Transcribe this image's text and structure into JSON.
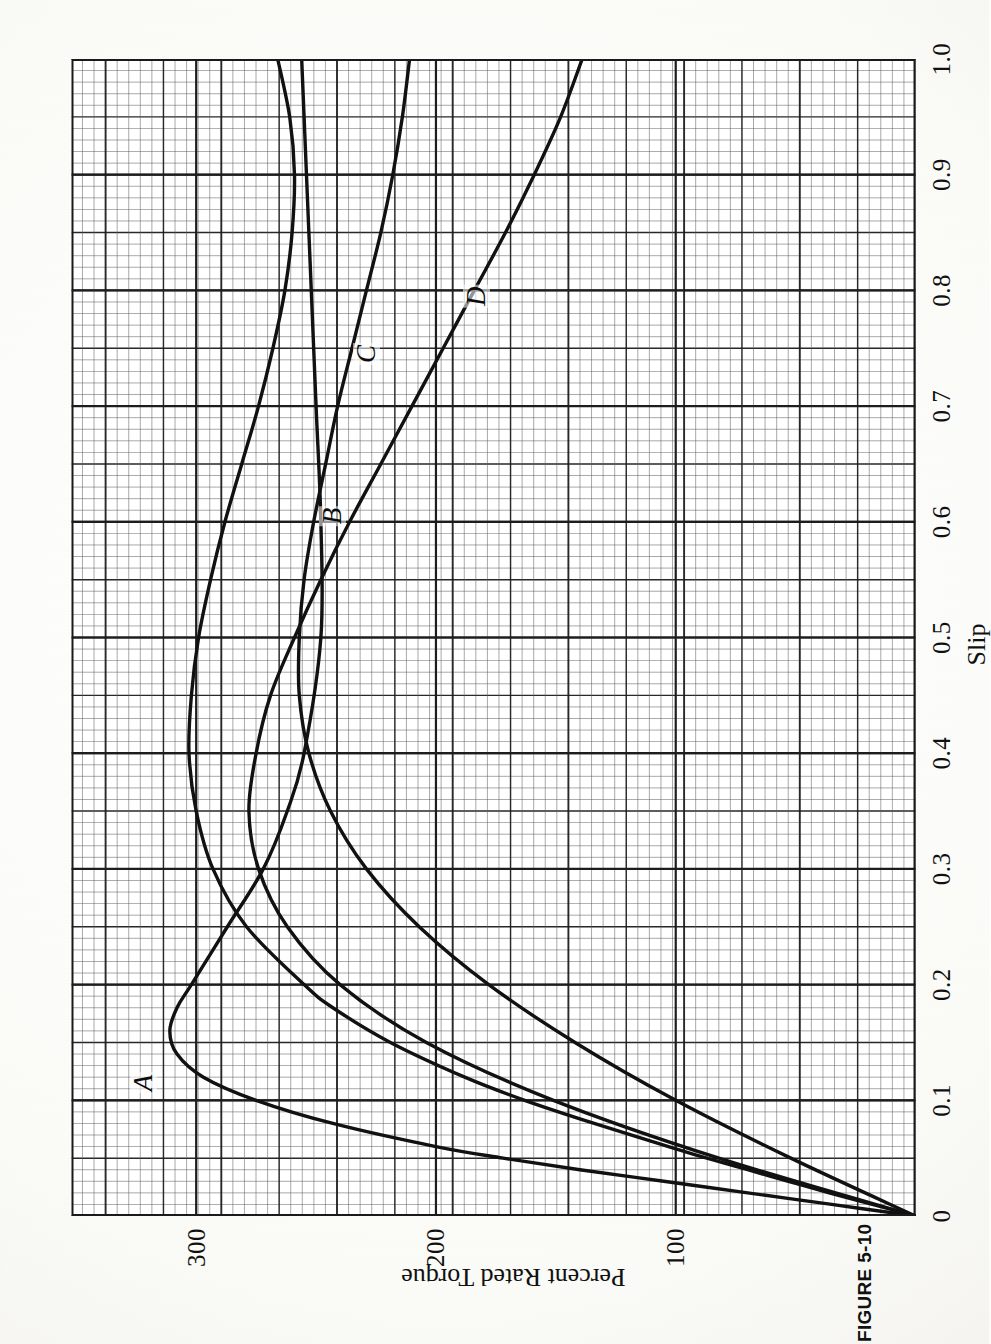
{
  "figure": {
    "caption": "FIGURE 5-10",
    "rotation_note": "printed sideways (rotated 90 degrees counter-clockwise)"
  },
  "chart_data": {
    "type": "line",
    "title": "",
    "xlabel": "Slip",
    "ylabel": "Percent Rated Torque",
    "xlim": [
      0,
      1.0
    ],
    "ylim": [
      0,
      352
    ],
    "grid": true,
    "grid_style": "engineering graph paper, minor cells with heavy line every 5 cells",
    "legend": "inline curve labels A, B, C, D",
    "xticks": [
      "0",
      "0.1",
      "0.2",
      "0.3",
      "0.4",
      "0.5",
      "0.6",
      "0.7",
      "0.8",
      "0.9",
      "1.0"
    ],
    "xtick_values": [
      0,
      0.1,
      0.2,
      0.3,
      0.4,
      0.5,
      0.6,
      0.7,
      0.8,
      0.9,
      1.0
    ],
    "yticks": [
      "100",
      "200",
      "300"
    ],
    "ytick_values": [
      100,
      200,
      300
    ],
    "series": [
      {
        "name": "A",
        "label": "A",
        "label_at": {
          "x": 0.115,
          "y": 322
        },
        "x": [
          0,
          0.01,
          0.02,
          0.03,
          0.04,
          0.05,
          0.06,
          0.08,
          0.1,
          0.12,
          0.14,
          0.16,
          0.18,
          0.2,
          0.25,
          0.3,
          0.35,
          0.4,
          0.5,
          0.6,
          0.7,
          0.8,
          0.9,
          1.0
        ],
        "y": [
          0,
          35,
          70,
          105,
          140,
          172,
          200,
          243,
          275,
          297,
          308,
          311,
          308,
          302,
          287,
          272,
          262,
          255,
          248,
          248,
          250,
          252,
          254,
          256
        ]
      },
      {
        "name": "B",
        "label": "B",
        "label_at": {
          "x": 0.605,
          "y": 243
        },
        "x": [
          0,
          0.01,
          0.02,
          0.03,
          0.04,
          0.05,
          0.06,
          0.08,
          0.1,
          0.12,
          0.15,
          0.18,
          0.2,
          0.25,
          0.3,
          0.35,
          0.4,
          0.45,
          0.5,
          0.55,
          0.6,
          0.65,
          0.7,
          0.75,
          0.8,
          0.85,
          0.9,
          0.95,
          1.0
        ],
        "y": [
          0,
          18,
          36,
          53,
          70,
          87,
          103,
          134,
          163,
          188,
          219,
          243,
          255,
          279,
          293,
          300,
          303,
          302,
          299,
          294,
          288,
          281,
          274,
          268,
          263,
          260,
          259,
          261,
          266
        ]
      },
      {
        "name": "C",
        "label": "C",
        "label_at": {
          "x": 0.745,
          "y": 229
        },
        "x": [
          0,
          0.05,
          0.1,
          0.15,
          0.2,
          0.25,
          0.3,
          0.35,
          0.4,
          0.45,
          0.5,
          0.55,
          0.6,
          0.65,
          0.7,
          0.75,
          0.8,
          0.85,
          0.9,
          0.95,
          1.0
        ],
        "y": [
          0,
          52,
          100,
          142,
          178,
          207,
          229,
          244,
          253,
          257,
          257,
          255,
          251,
          246,
          241,
          235,
          229,
          223,
          218,
          214,
          211
        ]
      },
      {
        "name": "D",
        "label": "D",
        "label_at": {
          "x": 0.795,
          "y": 183
        },
        "x": [
          0,
          0.05,
          0.1,
          0.15,
          0.2,
          0.25,
          0.3,
          0.35,
          0.4,
          0.45,
          0.5,
          0.55,
          0.6,
          0.65,
          0.7,
          0.75,
          0.8,
          0.85,
          0.9,
          0.95,
          1.0
        ],
        "y": [
          0,
          82,
          151,
          204,
          240,
          262,
          274,
          278,
          275,
          269,
          259,
          248,
          236,
          223,
          210,
          197,
          184,
          171,
          159,
          148,
          139
        ]
      }
    ]
  },
  "style": {
    "curve_color": "#111111",
    "grid_minor_color": "#5a5a5a",
    "grid_major_color": "#1d1d1d",
    "frame_color": "#1a1a1a",
    "paper_color": "#ffffff"
  }
}
